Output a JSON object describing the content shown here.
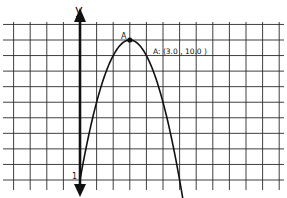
{
  "chart_data": {
    "type": "line",
    "title": "",
    "xlabel": "",
    "ylabel": "y",
    "function": "y = 10 - (x - 3)^2",
    "x": [
      0,
      0.5,
      1,
      1.5,
      2,
      2.5,
      3,
      3.5,
      4,
      4.5,
      5,
      5.5,
      6,
      6.16
    ],
    "series": [
      {
        "name": "parabola",
        "values": [
          1,
          3.75,
          6,
          7.75,
          9,
          9.75,
          10,
          9.75,
          9,
          7.75,
          6,
          3.75,
          1,
          0
        ]
      }
    ],
    "points": [
      {
        "name": "A",
        "x": 3.0,
        "y": 10.0,
        "label": "A: (3.0 , 10.0 )"
      }
    ],
    "tick_labels": {
      "y_axis": [
        "1"
      ]
    },
    "grid": true,
    "xlim": [
      -4.8,
      12.2
    ],
    "ylim": [
      -0.6,
      10.9
    ],
    "legend": "none"
  },
  "labels": {
    "y_axis": "y",
    "y_tick": "1",
    "point_name": "A",
    "point_label": "A: (3.0 , 10.0 )"
  },
  "colors": {
    "grid": "#2a2a2a",
    "axis": "#111111",
    "curve": "#111111",
    "background": "#ffffff"
  }
}
